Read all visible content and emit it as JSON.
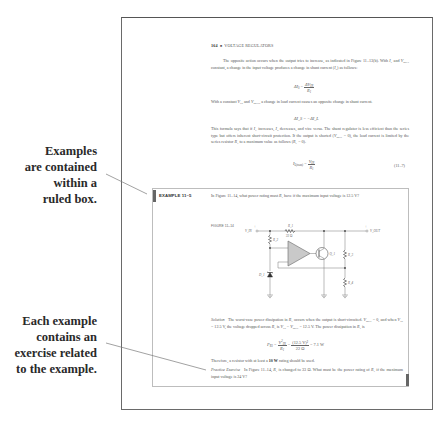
{
  "callouts": [
    {
      "lines": [
        "Examples",
        "are contained",
        "within a",
        "ruled box."
      ]
    },
    {
      "lines": [
        "Each example",
        "contains an",
        "exercise related",
        "to the example."
      ]
    }
  ],
  "page": {
    "header": {
      "page_number": "164",
      "separator": "■",
      "chapter": "VOLTAGE REGULATORS"
    },
    "para1": "The opposite action occurs when the output tries to increase, as indicated in Figure 11–13(b). With I_L and V_OUT constant, a change in the input voltage produces a change in shunt current (I_S) as follows:",
    "para1_parts": {
      "a": "The opposite action occurs when the output tries to increase, as indicated in Figure 11–13(b). With ",
      "b": " and ",
      "c": " constant, a change in the input voltage produces a change in shunt current (",
      "d": ") as follows:"
    },
    "eq1": {
      "lhs": "ΔI_S",
      "num": "ΔV_IN",
      "den": "R_1"
    },
    "para2_parts": {
      "a": "With a constant ",
      "b": " and ",
      "c": ", a change in load current causes an opposite change in shunt current."
    },
    "eq2": {
      "text": "ΔI_S = −ΔI_L"
    },
    "para3_parts": {
      "a": "This formula says that if ",
      "b": " increases, ",
      "c": " decreases, and vice versa. The shunt regulator is less efficient than the series type but offers inherent short-circuit protection. If the output is shorted (",
      "d": " = 0), the load current is limited by the series resistor ",
      "e": " to a maximum value as follows (",
      "f": " = 0)."
    },
    "eq3": {
      "lhs": "I_L(max)",
      "num": "V_IN",
      "den": "R_1",
      "number": "(11–7)"
    },
    "example": {
      "label": "EXAMPLE 11–5",
      "question_parts": {
        "a": "In Figure 11–14, what power rating must ",
        "b": " have if the maximum input voltage is 12.5 V?"
      },
      "figure_label": "FIGURE 11–14",
      "circuit": {
        "vin_label": "V_IN",
        "vout_label": "V_OUT",
        "r1_label": "R_1",
        "r1_value": "22 Ω",
        "r2_label": "R_2",
        "r3_label": "R_3",
        "r4_label": "R_4",
        "d1_label": "D_1",
        "q1_label": "Q_1",
        "plus": "+"
      },
      "solution_label": "Solution",
      "solution_parts": {
        "a": "The worst-case power dissipation in ",
        "b": " occurs when the output is short-circuited. ",
        "c": " = 0, and when ",
        "d": " = 12.5 V, the voltage dropped across ",
        "e": " is ",
        "f": " − ",
        "g": " = 12.5 V. The power dissipation in ",
        "h": " is"
      },
      "eq4": {
        "lhs": "P_R1",
        "num1": "V²_IN",
        "den1": "R_1",
        "num2": "(12.5 V)²",
        "den2": "22 Ω",
        "result": "= 7.1 W"
      },
      "conclusion_a": "Therefore, a resistor with at least a ",
      "conclusion_bold": "10 W",
      "conclusion_b": " rating should be used.",
      "practice_label": "Practice Exercise",
      "practice_parts": {
        "a": "In Figure 11–14, ",
        "b": " is changed to 33 Ω. What must be the power rating of ",
        "c": " if the maximum input voltage is 24 V?"
      }
    }
  }
}
